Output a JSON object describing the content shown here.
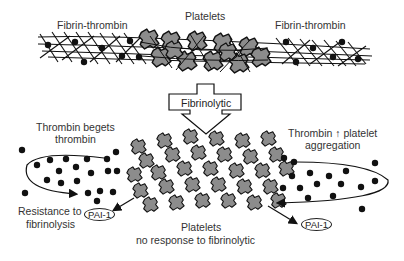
{
  "diagram": {
    "top_labels": {
      "left": "Fibrin-thrombin",
      "center": "Platelets",
      "right": "Fibrin-thrombin"
    },
    "arrow_label": "Fibrinolytic",
    "left_loop": {
      "title_line1": "Thrombin begets",
      "title_line2": "thrombin",
      "outcome_line1": "Resistance to",
      "outcome_line2": "fibrinolysis"
    },
    "right_loop": {
      "title_line1": "Thrombin ↑ platelet",
      "title_line2": "aggregation"
    },
    "bottom_center": {
      "line1": "Platelets",
      "line2": "no response to fibrinolytic"
    },
    "pai_left": "PAI-1",
    "pai_right": "PAI-1",
    "colors": {
      "platelet_fill": "#8c8c8c",
      "ink": "#111111",
      "background": "#ffffff"
    }
  }
}
